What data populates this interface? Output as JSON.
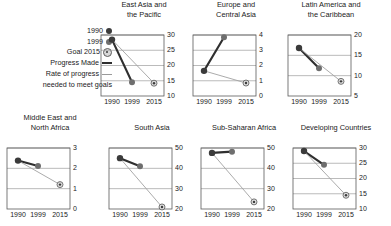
{
  "legend": {
    "items": [
      {
        "label": "1990",
        "marker": "filled-dark-circle-icon"
      },
      {
        "label": "1999",
        "marker": "filled-gray-circle-icon"
      },
      {
        "label": "Goal 2015",
        "marker": "target-circle-icon"
      },
      {
        "label": "Progress Made",
        "marker": "thick-dark-line-icon"
      }
    ],
    "rate_line_1": "Rate of progress",
    "rate_line_2": "needed to meet goals",
    "rate_marker": "thin-gray-line-icon"
  },
  "colors": {
    "point_1990": "#3b3b3b",
    "point_1999": "#6e6e6e",
    "goal_fill": "#dcdcdc",
    "goal_stroke": "#585858",
    "progress_line": "#2f2f2f",
    "needed_line": "#a2a2a2",
    "gridline": "#9e9e9e",
    "frame": "#5a5a5a"
  },
  "x_categories": [
    "1990",
    "1999",
    "2015"
  ],
  "chart_data": {
    "type": "line",
    "title": "",
    "xlabel": "",
    "ylabel": "",
    "grid": true,
    "legend_position": "left",
    "x": [
      "1990",
      "1999",
      "2015"
    ],
    "panels": [
      {
        "title_line_1": "East Asia and",
        "title_line_2": "the Pacific",
        "ylim": [
          10,
          30
        ],
        "yticks": [
          10,
          15,
          20,
          25,
          30
        ],
        "series": [
          {
            "name": "Progress Made",
            "x": [
              "1990",
              "1999"
            ],
            "values": [
              28.5,
              14.5
            ]
          },
          {
            "name": "Rate of progress needed to meet goals",
            "x": [
              "1990",
              "2015"
            ],
            "values": [
              28.5,
              14.2
            ]
          }
        ],
        "points": {
          "1990": 28.5,
          "1999": 14.5,
          "goal_2015": 14.2
        }
      },
      {
        "title_line_1": "Europe and",
        "title_line_2": "Central Asia",
        "ylim": [
          0,
          4
        ],
        "yticks": [
          0,
          1,
          2,
          3,
          4
        ],
        "series": [
          {
            "name": "Progress Made",
            "x": [
              "1990",
              "1999"
            ],
            "values": [
              1.65,
              3.85
            ]
          },
          {
            "name": "Rate of progress needed to meet goals",
            "x": [
              "1990",
              "2015"
            ],
            "values": [
              1.65,
              0.85
            ]
          }
        ],
        "points": {
          "1990": 1.65,
          "1999": 3.85,
          "goal_2015": 0.85
        }
      },
      {
        "title_line_1": "Latin America and",
        "title_line_2": "the Caribbean",
        "ylim": [
          5,
          20
        ],
        "yticks": [
          5,
          10,
          15,
          20
        ],
        "series": [
          {
            "name": "Progress Made",
            "x": [
              "1990",
              "1999"
            ],
            "values": [
              16.8,
              11.8
            ]
          },
          {
            "name": "Rate of progress needed to meet goals",
            "x": [
              "1990",
              "2015"
            ],
            "values": [
              16.8,
              8.6
            ]
          }
        ],
        "points": {
          "1990": 16.8,
          "1999": 11.8,
          "goal_2015": 8.6
        }
      },
      {
        "title_line_1": "Middle East and",
        "title_line_2": "North Africa",
        "ylim": [
          0,
          3
        ],
        "yticks": [
          0,
          1,
          2,
          3
        ],
        "series": [
          {
            "name": "Progress Made",
            "x": [
              "1990",
              "1999"
            ],
            "values": [
              2.38,
              2.12
            ]
          },
          {
            "name": "Rate of progress needed to meet goals",
            "x": [
              "1990",
              "2015"
            ],
            "values": [
              2.38,
              1.2
            ]
          }
        ],
        "points": {
          "1990": 2.38,
          "1999": 2.12,
          "goal_2015": 1.2
        }
      },
      {
        "title_line_1": "South Asia",
        "title_line_2": "",
        "ylim": [
          20,
          50
        ],
        "yticks": [
          20,
          30,
          40,
          50
        ],
        "series": [
          {
            "name": "Progress Made",
            "x": [
              "1990",
              "1999"
            ],
            "values": [
              45.0,
              41.0
            ]
          },
          {
            "name": "Rate of progress needed to meet goals",
            "x": [
              "1990",
              "2015"
            ],
            "values": [
              45.0,
              21.0
            ]
          }
        ],
        "points": {
          "1990": 45.0,
          "1999": 41.0,
          "goal_2015": 21.0
        }
      },
      {
        "title_line_1": "Sub-Saharan Africa",
        "title_line_2": "",
        "ylim": [
          20,
          50
        ],
        "yticks": [
          20,
          30,
          40,
          50
        ],
        "series": [
          {
            "name": "Progress Made",
            "x": [
              "1990",
              "1999"
            ],
            "values": [
              47.6,
              48.2
            ]
          },
          {
            "name": "Rate of progress needed to meet goals",
            "x": [
              "1990",
              "2015"
            ],
            "values": [
              47.6,
              23.5
            ]
          }
        ],
        "points": {
          "1990": 47.6,
          "1999": 48.2,
          "goal_2015": 23.5
        }
      },
      {
        "title_line_1": "Developing Countries",
        "title_line_2": "",
        "ylim": [
          10,
          30
        ],
        "yticks": [
          10,
          15,
          20,
          25,
          30
        ],
        "series": [
          {
            "name": "Progress Made",
            "x": [
              "1990",
              "1999"
            ],
            "values": [
              29.0,
              24.5
            ]
          },
          {
            "name": "Rate of progress needed to meet goals",
            "x": [
              "1990",
              "2015"
            ],
            "values": [
              29.0,
              14.5
            ]
          }
        ],
        "points": {
          "1990": 29.0,
          "1999": 24.5,
          "goal_2015": 14.5
        }
      }
    ]
  }
}
